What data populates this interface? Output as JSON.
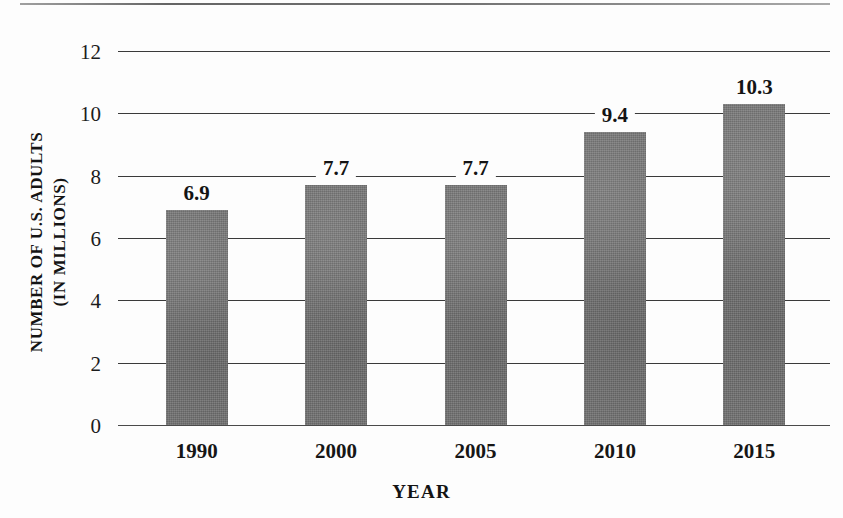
{
  "chart_data": {
    "type": "bar",
    "title": "",
    "xlabel": "YEAR",
    "ylabel_line1": "NUMBER OF U.S. ADULTS",
    "ylabel_line2": "(IN MILLIONS)",
    "categories": [
      "1990",
      "2000",
      "2005",
      "2010",
      "2015"
    ],
    "values": [
      6.9,
      7.7,
      7.7,
      9.4,
      10.3
    ],
    "value_labels": [
      "6.9",
      "7.7",
      "7.7",
      "9.4",
      "10.3"
    ],
    "ylim": [
      0,
      12
    ],
    "yticks": [
      0,
      2,
      4,
      6,
      8,
      10,
      12
    ],
    "ytick_labels": [
      "0",
      "2",
      "4",
      "6",
      "8",
      "10",
      "12"
    ],
    "grid": true,
    "legend": "none",
    "bar_color": "#737373",
    "gridline_color": "#3a3a3a",
    "text_color": "#141414",
    "background": "#fdfdfd"
  }
}
